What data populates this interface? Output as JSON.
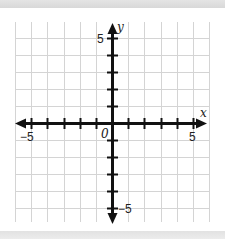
{
  "diagram": {
    "type": "coordinate-plane",
    "x_axis": {
      "label": "x",
      "min": -5,
      "max": 5,
      "tick_step": 1,
      "labeled_ticks": [
        "-5",
        "5"
      ]
    },
    "y_axis": {
      "label": "y",
      "min": -5,
      "max": 5,
      "tick_step": 1,
      "labeled_ticks": [
        "5",
        "-5"
      ]
    },
    "origin_label": "0",
    "grid": {
      "columns": 12,
      "rows": 12,
      "line_color": "#d4d4d4"
    },
    "axis_color": "#111111"
  },
  "labels": {
    "x_axis": "x",
    "y_axis": "y",
    "origin": "0",
    "x_neg5": "−5",
    "x_pos5": "5",
    "y_pos5": "5",
    "y_neg5": "−5"
  }
}
